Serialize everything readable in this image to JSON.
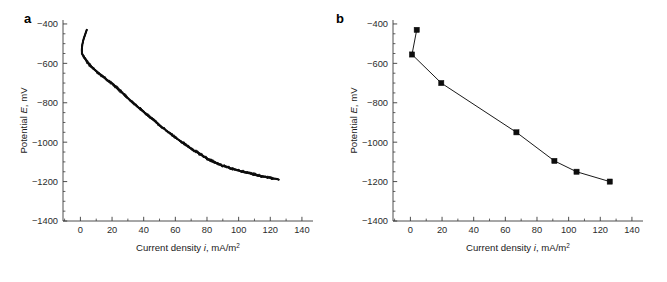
{
  "figure": {
    "panel_a_label": "a",
    "panel_b_label": "b"
  },
  "axes": {
    "x_title_main": "Current density ",
    "x_title_italic": "i",
    "x_title_rest": ", mA/m",
    "x_title_sup": "2",
    "y_title_main": "Potential ",
    "y_title_italic": "E",
    "y_title_rest": ", mV",
    "x_ticks": [
      "0",
      "20",
      "40",
      "60",
      "80",
      "100",
      "120",
      "140"
    ],
    "x_tick_values": [
      0,
      20,
      40,
      60,
      80,
      100,
      120,
      140
    ],
    "y_ticks": [
      "−400",
      "−600",
      "−800",
      "−1000",
      "−1200",
      "−1400"
    ],
    "y_tick_values": [
      -400,
      -600,
      -800,
      -1000,
      -1200,
      -1400
    ],
    "x_minor_step": 10,
    "y_minor_step": 50,
    "xlim": [
      -11,
      147
    ],
    "ylim": [
      -1400,
      -380
    ]
  },
  "style": {
    "axis_color": "#3a3a3a",
    "curve_color": "#0d0d0d",
    "marker_color": "#0d0d0d",
    "text_color": "#1a1a1a"
  },
  "chart_data": [
    {
      "type": "line",
      "panel": "a",
      "title": "",
      "xlabel": "Current density i, mA/m2",
      "ylabel": "Potential E, mV",
      "xlim": [
        -11,
        147
      ],
      "ylim": [
        -1400,
        -380
      ],
      "grid": false,
      "legend": "none",
      "series_name": "measured polarization trace",
      "description": "Dense continuous noisy cathodic polarization trace",
      "x": [
        4.0,
        3.4,
        2.8,
        2.2,
        1.7,
        1.3,
        1.0,
        0.9,
        1.0,
        1.4,
        2.2,
        3.2,
        4.4,
        5.6,
        6.9,
        8.2,
        9.5,
        10.8,
        12.0,
        13.2,
        14.3,
        15.4,
        16.4,
        17.3,
        18.2,
        19.1,
        20.0,
        21.0,
        22.0,
        23.1,
        24.2,
        25.4,
        26.6,
        27.8,
        29.0,
        30.3,
        31.5,
        32.8,
        34.0,
        35.3,
        36.5,
        37.8,
        39.0,
        40.3,
        41.5,
        42.8,
        44.0,
        45.3,
        46.5,
        47.8,
        49.0,
        50.3,
        51.5,
        52.8,
        54.0,
        55.3,
        56.5,
        57.8,
        59.0,
        60.3,
        61.5,
        62.8,
        64.0,
        65.3,
        66.5,
        67.8,
        69.0,
        70.3,
        71.5,
        72.8,
        74.0,
        75.3,
        76.5,
        77.8,
        79.0,
        80.2,
        81.4,
        82.6,
        83.8,
        85.0,
        86.2,
        87.4,
        88.6,
        89.8,
        91.0,
        92.3,
        93.6,
        94.9,
        96.2,
        97.5,
        98.8,
        100.1,
        101.4,
        102.7,
        104.0,
        105.3,
        106.6,
        107.9,
        109.2,
        110.5,
        111.8,
        113.1,
        114.4,
        115.7,
        117.0,
        118.3,
        119.6,
        120.9,
        122.2,
        123.5,
        124.6,
        125.3
      ],
      "y": [
        -430,
        -444,
        -458,
        -472,
        -487,
        -502,
        -518,
        -534,
        -548,
        -557,
        -566,
        -580,
        -594,
        -606,
        -617,
        -627,
        -636,
        -645,
        -653,
        -661,
        -668,
        -675,
        -681,
        -687,
        -692,
        -697,
        -702,
        -709,
        -717,
        -725,
        -733,
        -742,
        -751,
        -760,
        -769,
        -778,
        -787,
        -796,
        -805,
        -814,
        -823,
        -831,
        -840,
        -848,
        -857,
        -865,
        -874,
        -882,
        -890,
        -899,
        -907,
        -915,
        -923,
        -931,
        -939,
        -947,
        -955,
        -962,
        -970,
        -977,
        -985,
        -992,
        -999,
        -1006,
        -1013,
        -1020,
        -1027,
        -1034,
        -1041,
        -1047,
        -1053,
        -1059,
        -1065,
        -1071,
        -1077,
        -1083,
        -1088,
        -1093,
        -1098,
        -1103,
        -1107,
        -1111,
        -1115,
        -1119,
        -1122,
        -1125,
        -1129,
        -1132,
        -1135,
        -1138,
        -1141,
        -1144,
        -1147,
        -1150,
        -1152,
        -1155,
        -1158,
        -1160,
        -1163,
        -1165,
        -1167,
        -1170,
        -1172,
        -1174,
        -1176,
        -1178,
        -1180,
        -1182,
        -1184,
        -1186,
        -1188,
        -1190,
        -1192,
        -1194,
        -1196,
        -1199
      ]
    },
    {
      "type": "line",
      "panel": "b",
      "title": "",
      "xlabel": "Current density i, mA/m2",
      "ylabel": "Potential E, mV",
      "xlim": [
        -11,
        147
      ],
      "ylim": [
        -1400,
        -380
      ],
      "grid": false,
      "legend": "none",
      "marker": "filled-square",
      "series_name": "averaged polarization points",
      "description": "Seven discrete filled-square data points joined by straight line segments",
      "x": [
        4.0,
        1.0,
        19.5,
        67.0,
        91.0,
        105.0,
        126.0
      ],
      "y": [
        -430,
        -555,
        -700,
        -950,
        -1095,
        -1150,
        -1200
      ]
    }
  ]
}
